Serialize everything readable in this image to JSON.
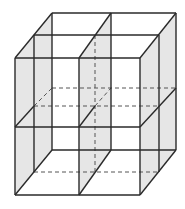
{
  "diagram": {
    "colors": {
      "stroke": "#2a2a2a",
      "shade": "#e6e6e6",
      "dashed": "#555555",
      "background": "#ffffff"
    },
    "points": {
      "front": {
        "xl": 15,
        "xm": 79,
        "xr": 140,
        "yt": 58,
        "ym": 127,
        "yb": 195
      },
      "mid": {
        "xl": 34,
        "xm": 95,
        "xr": 159,
        "yt": 35,
        "ym": 106,
        "yb": 172
      },
      "back": {
        "xl": 52,
        "xm": 111,
        "xr": 176,
        "yt": 13,
        "ym": 88,
        "yb": 150
      }
    }
  }
}
